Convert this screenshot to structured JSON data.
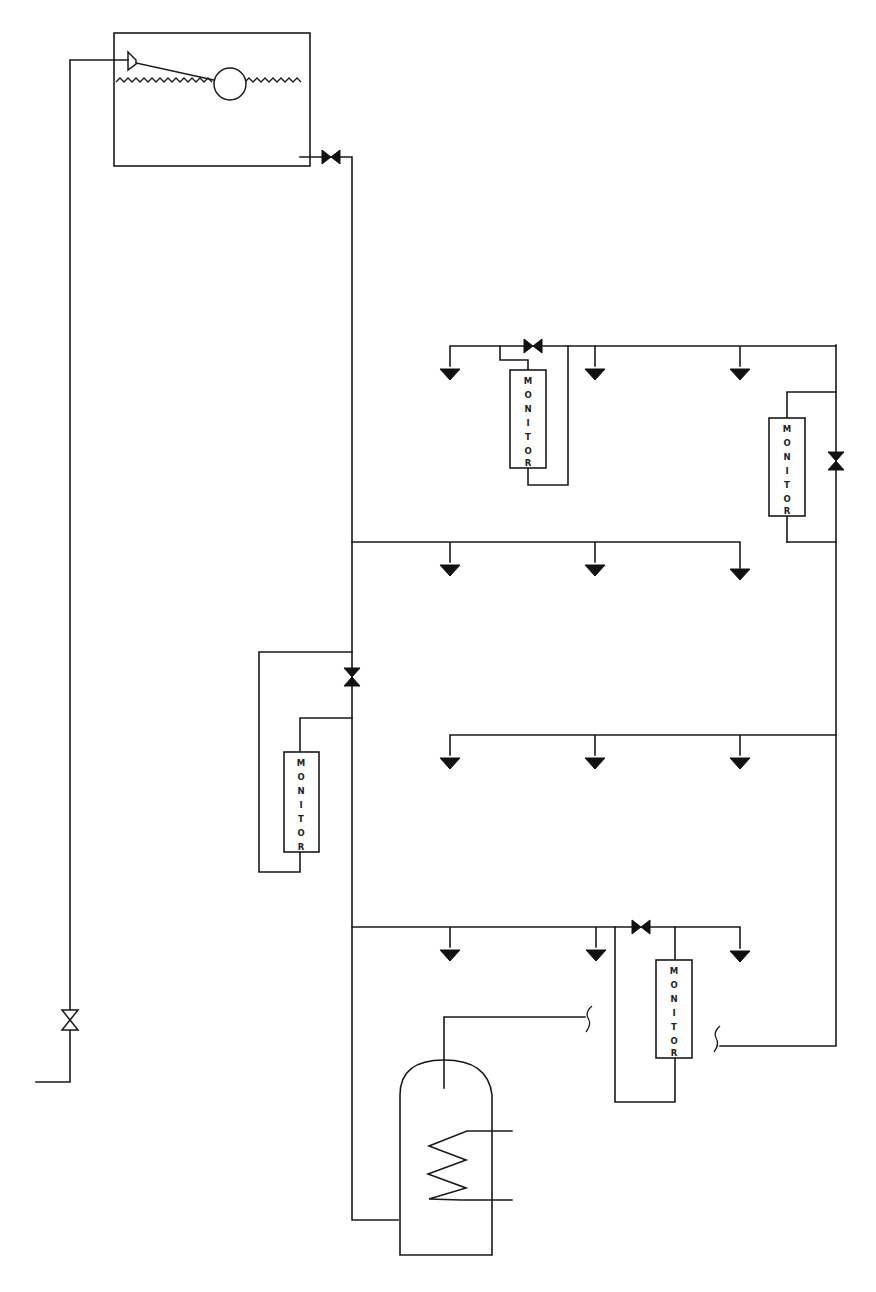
{
  "diagram": {
    "type": "plumbing-schematic",
    "colors": {
      "line": "#1a1a1a",
      "background": "#ffffff"
    },
    "components": {
      "cistern": {
        "label": "",
        "float_valve": true,
        "ball_float": true,
        "water_level": "wavy"
      },
      "cylinder": {
        "label": "",
        "heating_coil": true
      },
      "monitors": [
        {
          "id": "monitor-1",
          "label": "MONITOR"
        },
        {
          "id": "monitor-2",
          "label": "MONITOR"
        },
        {
          "id": "monitor-3",
          "label": "MONITOR"
        },
        {
          "id": "monitor-4",
          "label": "MONITOR"
        }
      ],
      "valves": [
        {
          "id": "cistern-outlet-valve",
          "style": "filled"
        },
        {
          "id": "upper-branch-valve",
          "style": "filled"
        },
        {
          "id": "right-riser-valve",
          "style": "filled"
        },
        {
          "id": "main-riser-valve",
          "style": "filled"
        },
        {
          "id": "lower-branch-valve",
          "style": "filled"
        },
        {
          "id": "mains-inlet-valve",
          "style": "open"
        }
      ],
      "outlet_counts": {
        "branch_upper": 3,
        "branch_middle": 3,
        "branch_lower_mid": 3,
        "branch_bottom": 3
      }
    }
  }
}
